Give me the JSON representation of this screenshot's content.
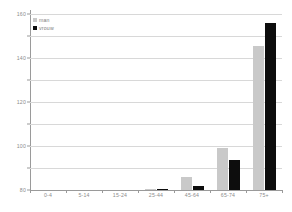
{
  "chart_data": {
    "type": "bar",
    "title": "",
    "xlabel": "",
    "ylabel": "",
    "ylim": [
      0,
      160
    ],
    "yticks": [
      0,
      20,
      40,
      60,
      80,
      100,
      120,
      140,
      160
    ],
    "grid": true,
    "legend_position": "top-left",
    "categories": [
      "0-4",
      "5-14",
      "15-24",
      "25-44",
      "45-64",
      "65-74",
      "75+"
    ],
    "series": [
      {
        "name": "man",
        "color": "#c9c9c9",
        "values": [
          0,
          0,
          0,
          1,
          12,
          38,
          131
        ]
      },
      {
        "name": "vrouw",
        "color": "#0d0d0d",
        "values": [
          0,
          0,
          0,
          1,
          4,
          27,
          152
        ]
      }
    ]
  },
  "axis": {
    "tick_labels": [
      "0",
      "20",
      "40",
      "60",
      "80",
      "100",
      "120",
      "140",
      "160"
    ],
    "category_labels": [
      "0-4",
      "5-14",
      "15-24",
      "25-44",
      "45-64",
      "65-74",
      "75+"
    ]
  },
  "legend": {
    "items": [
      {
        "label": "man",
        "swatch": "legend-swatch-man"
      },
      {
        "label": "vrouw",
        "swatch": "legend-swatch-vrouw"
      }
    ]
  },
  "colors": {
    "man": "#c9c9c9",
    "vrouw": "#0d0d0d",
    "grid": "#d8d8d8",
    "axis": "#9a9a9a",
    "text": "#8c8c8c",
    "background": "#ffffff"
  }
}
